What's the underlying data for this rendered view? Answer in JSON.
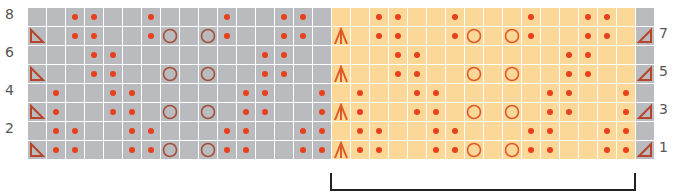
{
  "chart_title": "Lace knitting chart",
  "colors": {
    "gray_cell": "#b9bbbe",
    "repeat_cell": "#fbd898",
    "dot": "#e8401c",
    "circle_on_gray": "#a5503a",
    "circle_on_yellow": "#e05a28",
    "triangle": "#b8452a",
    "decrease_arrow": "#e05a28",
    "bracket": "#222222"
  },
  "legend_symbols": {
    "dot": "purl",
    "circle": "yarn-over",
    "triangle-left": "ssk / left-leaning decrease",
    "triangle-right": "k2tog / right-leaning decrease",
    "double-decrease": "central double decrease"
  },
  "labels": {
    "left_rows": [
      "8",
      "6",
      "4",
      "2"
    ],
    "right_rows": [
      "7",
      "5",
      "3",
      "1"
    ]
  },
  "grid": {
    "columns": 33,
    "rows": 8,
    "repeat_start_col": 16,
    "repeat_end_col": 31,
    "edge_col": 32,
    "row_numbers_top_to_bottom": [
      8,
      7,
      6,
      5,
      4,
      3,
      2,
      1
    ],
    "pattern_16": [
      {
        "row": 8,
        "dots": [
          2,
          3,
          6,
          10,
          13,
          14
        ],
        "circles": [],
        "tri": false
      },
      {
        "row": 7,
        "dots": [
          2,
          3,
          6,
          10,
          13,
          14
        ],
        "circles": [
          7,
          9
        ],
        "tri": true
      },
      {
        "row": 6,
        "dots": [
          3,
          4,
          12,
          13
        ],
        "circles": [],
        "tri": false
      },
      {
        "row": 5,
        "dots": [
          3,
          4,
          12,
          13
        ],
        "circles": [
          7,
          9
        ],
        "tri": true
      },
      {
        "row": 4,
        "dots": [
          1,
          4,
          5,
          11,
          12,
          15
        ],
        "circles": [],
        "tri": false
      },
      {
        "row": 3,
        "dots": [
          1,
          4,
          5,
          11,
          12,
          15
        ],
        "circles": [
          7,
          9
        ],
        "tri": true
      },
      {
        "row": 2,
        "dots": [
          1,
          2,
          5,
          6,
          10,
          11,
          14,
          15
        ],
        "circles": [],
        "tri": false
      },
      {
        "row": 1,
        "dots": [
          1,
          2,
          5,
          6,
          10,
          11,
          14,
          15
        ],
        "circles": [
          7,
          9
        ],
        "tri": true
      }
    ]
  },
  "bracket": {
    "label": "pattern repeat",
    "from_col": 16,
    "to_col": 31
  }
}
